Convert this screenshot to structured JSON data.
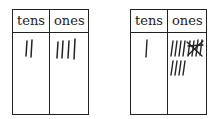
{
  "tables": [
    {
      "headers": [
        "tens",
        "ones"
      ],
      "tens_tally": 2,
      "ones_tally": 4
    },
    {
      "headers": [
        "tens",
        "ones"
      ],
      "tens_tally": 1,
      "ones_tally_description": "4 marks, a group of 4 crossed out, then 4 marks on second row",
      "ones_tally": 8,
      "ones_crossed_group": 4
    }
  ],
  "colors": {
    "line": "#222222",
    "background": "#ffffff"
  }
}
